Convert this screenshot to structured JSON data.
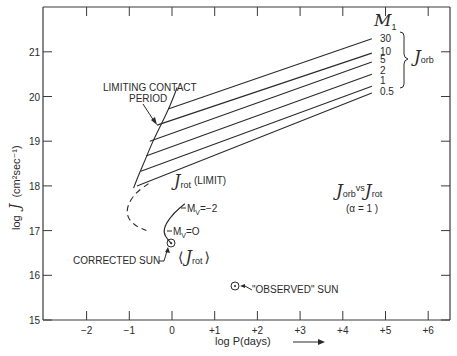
{
  "chart_data": {
    "type": "line",
    "title": "",
    "xlabel": "log P(days)",
    "ylabel": "log J (cm^2 sec^-1)",
    "xlim": [
      -3.0,
      6.5
    ],
    "ylim": [
      15,
      22
    ],
    "x_ticks": [
      "-2",
      "-1",
      "0",
      "+1",
      "+2",
      "+3",
      "+4",
      "+5",
      "+6"
    ],
    "y_ticks": [
      "15",
      "16",
      "17",
      "18",
      "19",
      "20",
      "21"
    ],
    "grid": false,
    "legend": {
      "header": "M1",
      "group_label": "J orb",
      "position": "right"
    },
    "series": [
      {
        "name": "30",
        "x": [
          -0.09,
          4.68
        ],
        "y": [
          19.72,
          21.29
        ]
      },
      {
        "name": "10",
        "x": [
          -0.35,
          4.68
        ],
        "y": [
          19.36,
          20.97
        ]
      },
      {
        "name": "5",
        "x": [
          -0.52,
          4.68
        ],
        "y": [
          19.0,
          20.77
        ]
      },
      {
        "name": "2",
        "x": [
          -0.61,
          4.68
        ],
        "y": [
          18.67,
          20.5
        ]
      },
      {
        "name": "1",
        "x": [
          -0.73,
          4.68
        ],
        "y": [
          18.33,
          20.23
        ]
      },
      {
        "name": "0.5",
        "x": [
          -0.82,
          4.68
        ],
        "y": [
          18.0,
          20.08
        ]
      }
    ],
    "curves": [
      {
        "name": "Limiting contact period",
        "style": "solid",
        "x": [
          0.12,
          -0.05,
          -0.25,
          -0.45,
          -0.62,
          -0.8,
          -0.9
        ],
        "y": [
          20.2,
          19.78,
          19.38,
          19.0,
          18.6,
          18.2,
          17.95
        ]
      },
      {
        "name": "J rot (limit)",
        "style": "dashed",
        "x": [
          -0.55,
          -0.85,
          -1.05,
          -1.05,
          -0.85,
          -0.6
        ],
        "y": [
          18.05,
          17.85,
          17.55,
          17.3,
          17.1,
          17.0
        ]
      },
      {
        "name": "<J rot> main sequence",
        "style": "solid",
        "x": [
          0.3,
          0.05,
          -0.15,
          -0.2,
          -0.1,
          0.0
        ],
        "y": [
          17.6,
          17.4,
          17.15,
          16.95,
          16.8,
          16.7
        ]
      }
    ],
    "points": [
      {
        "name": "Corrected Sun",
        "x": 0.0,
        "y": 16.72
      },
      {
        "name": "\"Observed\" Sun",
        "x": 1.5,
        "y": 15.75
      }
    ],
    "annotations": [
      "LIMITING CONTACT PERIOD",
      "J rot (LIMIT)",
      "Mv = -2",
      "Mv = 0",
      "CORRECTED SUN",
      "<J rot>",
      "\"OBSERVED\" SUN",
      "J orb vs J rot",
      "(α = 1)"
    ]
  },
  "labels": {
    "x_axis": "log P(days)",
    "y_axis_prefix": "log",
    "y_axis_script": "J",
    "y_axis_units": "(cm²sec⁻¹)",
    "limiting_line1": "LIMITING CONTACT",
    "limiting_line2": "PERIOD",
    "jrot_limit_script": "J",
    "jrot_limit_sub": "rot",
    "jrot_limit_text": "(LIMIT)",
    "mv_minus2": "M",
    "mv_minus2_sub": "V",
    "mv_minus2_val": "=−2",
    "mv_zero": "M",
    "mv_zero_sub": "V",
    "mv_zero_val": "=O",
    "corrected_sun": "CORRECTED SUN",
    "jrot_avg_open": "⟨",
    "jrot_avg_script": "J",
    "jrot_avg_sub": "rot",
    "jrot_avg_close": "⟩",
    "observed_sun": "\"OBSERVED\" SUN",
    "compare_j1": "J",
    "compare_sub1": "orb",
    "compare_vs": "vs",
    "compare_j2": "J",
    "compare_sub2": "rot",
    "alpha": "(α = 1 )",
    "legend_header": "M",
    "legend_header_sub": "1",
    "legend_group": "J",
    "legend_group_sub": "orb",
    "mass_labels": [
      "30",
      "10",
      "5",
      "2",
      "1",
      "0.5"
    ]
  }
}
